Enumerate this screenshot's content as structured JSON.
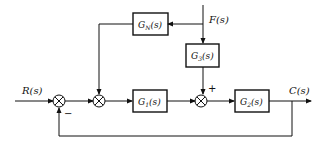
{
  "diagram": {
    "type": "control-system-block-diagram",
    "signals": {
      "input": "R(s)",
      "disturbance": "F(s)",
      "output": "C(s)"
    },
    "blocks": [
      {
        "id": "GN",
        "base": "G",
        "sub": "N",
        "label": "G_N(s)"
      },
      {
        "id": "G3",
        "base": "G",
        "sub": "3",
        "label": "G_3(s)"
      },
      {
        "id": "G1",
        "base": "G",
        "sub": "1",
        "label": "G_1(s)"
      },
      {
        "id": "G2",
        "base": "G",
        "sub": "2",
        "label": "G_2(s)"
      }
    ],
    "suffix": "(s)",
    "signs": {
      "sum3_top": "+",
      "sum1_feedback": "−"
    },
    "connections": [
      "R(s) → Σ1",
      "Σ1 → Σ2",
      "F(s) → G_N(s) → Σ2",
      "Σ2 → G_1(s) → Σ3",
      "F(s) → G_3(s) → Σ3 (+)",
      "Σ3 → G_2(s) → C(s)",
      "C(s) → Σ1 (−)"
    ]
  }
}
